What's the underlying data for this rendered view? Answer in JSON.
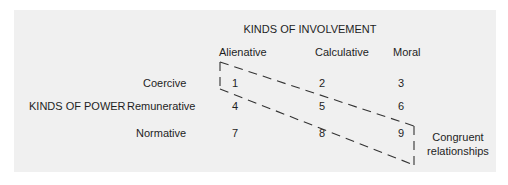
{
  "involvement": {
    "title": "KINDS OF INVOLVEMENT",
    "columns": [
      "Alienative",
      "Calculative",
      "Moral"
    ]
  },
  "power": {
    "title": "KINDS OF POWER",
    "rows": [
      "Coercive",
      "Remunerative",
      "Normative"
    ]
  },
  "cells": [
    [
      "1",
      "2",
      "3"
    ],
    [
      "4",
      "5",
      "6"
    ],
    [
      "7",
      "8",
      "9"
    ]
  ],
  "annotation": {
    "line1": "Congruent",
    "line2": "relationships"
  },
  "colors": {
    "panel": "#f0f0f0",
    "text": "#1e1e1e",
    "dash": "#333333"
  }
}
